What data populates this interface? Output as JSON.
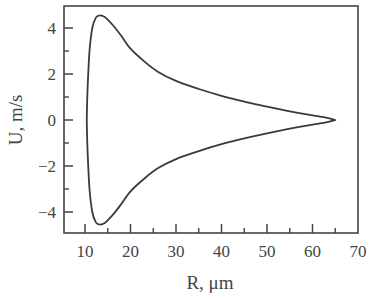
{
  "chart_data": {
    "type": "line",
    "title": "",
    "xlabel": "R, μm",
    "ylabel": "U, m/s",
    "xlim": [
      5,
      70
    ],
    "ylim": [
      -5,
      5
    ],
    "xticks_major": [
      10,
      20,
      30,
      40,
      50,
      60,
      70
    ],
    "xticks_minor": [
      15,
      25,
      35,
      45,
      55,
      65
    ],
    "yticks_major": [
      -4,
      -2,
      0,
      2,
      4
    ],
    "yticks_minor": [
      -3,
      -1,
      1,
      3
    ],
    "grid": false,
    "legend": null,
    "series": [
      {
        "name": "phase trajectory (closed loop)",
        "color": "#3a3a3a",
        "points_upper": [
          [
            10.4,
            0
          ],
          [
            10.6,
            1.5
          ],
          [
            11.0,
            3.0
          ],
          [
            11.6,
            4.0
          ],
          [
            12.4,
            4.45
          ],
          [
            13.3,
            4.55
          ],
          [
            14.5,
            4.45
          ],
          [
            16,
            4.15
          ],
          [
            18,
            3.65
          ],
          [
            20,
            3.1
          ],
          [
            23,
            2.55
          ],
          [
            26,
            2.1
          ],
          [
            30,
            1.7
          ],
          [
            35,
            1.35
          ],
          [
            40,
            1.05
          ],
          [
            45,
            0.8
          ],
          [
            50,
            0.58
          ],
          [
            55,
            0.38
          ],
          [
            60,
            0.2
          ],
          [
            63,
            0.1
          ],
          [
            64.6,
            0.02
          ],
          [
            65,
            0
          ]
        ],
        "symmetric_about_U0": true
      }
    ]
  },
  "plot": {
    "frame": {
      "left": 64,
      "top": 6,
      "right": 358,
      "bottom": 233
    },
    "x_map": {
      "origin_value": 10,
      "origin_px": 85,
      "px_per_unit": 4.55
    },
    "y_map": {
      "origin_value": 0,
      "origin_px": 120,
      "px_per_unit": 23
    },
    "line_color": "#3a3a3a",
    "frame_color": "#444444"
  }
}
